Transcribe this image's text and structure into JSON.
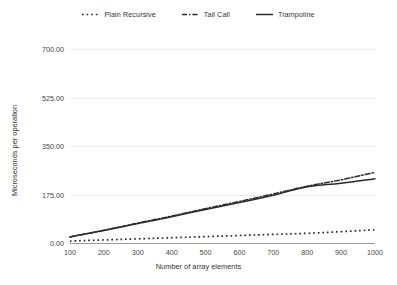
{
  "chart_data": {
    "type": "line",
    "title": "",
    "xlabel": "Number of array elements",
    "ylabel": "Microseconds per operation",
    "x": [
      100,
      200,
      300,
      400,
      500,
      600,
      700,
      800,
      900,
      1000
    ],
    "xlim": [
      100,
      1000
    ],
    "ylim": [
      0,
      700
    ],
    "yticks": [
      0,
      175,
      350,
      525,
      700
    ],
    "ytick_labels": [
      "0.00",
      "175.00",
      "350.00",
      "525.00",
      "700.00"
    ],
    "xtick_labels": [
      "100",
      "200",
      "300",
      "400",
      "500",
      "600",
      "700",
      "800",
      "900",
      "1000"
    ],
    "grid": true,
    "legend_position": "top-center",
    "series": [
      {
        "name": "Plain Recursive",
        "style": "dotted",
        "color": "#2b2b2b",
        "values": [
          7,
          11,
          15,
          19,
          23,
          27,
          31,
          35,
          41,
          48
        ]
      },
      {
        "name": "Tail Call",
        "style": "dash-dot",
        "color": "#2b2b2b",
        "values": [
          22,
          46,
          72,
          97,
          124,
          150,
          177,
          205,
          228,
          255
        ]
      },
      {
        "name": "Trampoline",
        "style": "solid",
        "color": "#2b2b2b",
        "values": [
          22,
          45,
          70,
          95,
          121,
          146,
          172,
          203,
          216,
          232
        ]
      }
    ]
  },
  "legend": {
    "items": [
      {
        "label": "Plain Recursive",
        "style": "dotted"
      },
      {
        "label": "Tail Call",
        "style": "dash-dot"
      },
      {
        "label": "Trampoline",
        "style": "solid"
      }
    ]
  },
  "colors": {
    "background": "#ffffff",
    "gridline": "#ececec",
    "baseline": "#9a9a9a",
    "ink": "#2b2b2b",
    "text": "#333333"
  }
}
